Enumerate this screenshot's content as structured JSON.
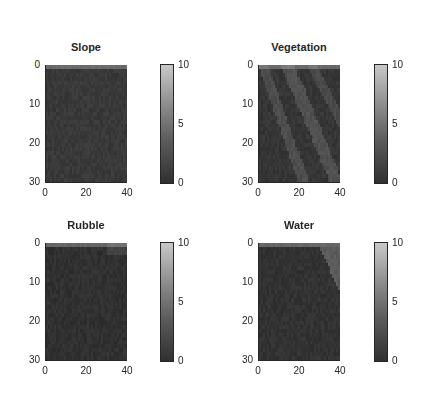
{
  "figure": {
    "layout": "2x2 subplots",
    "background": "#ffffff"
  },
  "chart_data": [
    {
      "type": "heatmap",
      "title": "Slope",
      "xlim": [
        0,
        40
      ],
      "ylim": [
        0,
        30
      ],
      "y_reversed": true,
      "xticks": [
        "0",
        "20",
        "40"
      ],
      "yticks": [
        "0",
        "10",
        "20",
        "30"
      ],
      "colorbar": {
        "range": [
          0,
          10
        ],
        "ticks": [
          "0",
          "5",
          "10"
        ],
        "colormap": "gray"
      },
      "pattern": "uniform low values (~1) across entire grid",
      "base_value": 1.0,
      "features": []
    },
    {
      "type": "heatmap",
      "title": "Vegetation",
      "xlim": [
        0,
        40
      ],
      "ylim": [
        0,
        30
      ],
      "y_reversed": true,
      "xticks": [
        "0",
        "20",
        "40"
      ],
      "yticks": [
        "0",
        "10",
        "20",
        "30"
      ],
      "colorbar": {
        "range": [
          0,
          10
        ],
        "ticks": [
          "0",
          "5",
          "10"
        ],
        "colormap": "gray"
      },
      "pattern": "low values with lighter diagonal bands running top-left to bottom-right",
      "base_value": 0.8,
      "features": [
        {
          "kind": "diagonal_band",
          "from": [
            2,
            0
          ],
          "to": [
            22,
            30
          ],
          "width": 4,
          "value": 2.2
        },
        {
          "kind": "diagonal_band",
          "from": [
            14,
            0
          ],
          "to": [
            38,
            30
          ],
          "width": 5,
          "value": 2.4
        },
        {
          "kind": "diagonal_band",
          "from": [
            26,
            0
          ],
          "to": [
            40,
            14
          ],
          "width": 4,
          "value": 2.0
        }
      ]
    },
    {
      "type": "heatmap",
      "title": "Rubble",
      "xlim": [
        0,
        40
      ],
      "ylim": [
        0,
        30
      ],
      "y_reversed": true,
      "xticks": [
        "0",
        "20",
        "40"
      ],
      "yticks": [
        "0",
        "10",
        "20",
        "30"
      ],
      "colorbar": {
        "range": [
          0,
          10
        ],
        "ticks": [
          "0",
          "5",
          "10"
        ],
        "colormap": "gray"
      },
      "pattern": "near-zero values everywhere, faint lighter patch at top-right",
      "base_value": 0.5,
      "features": [
        {
          "kind": "rect",
          "x": [
            30,
            40
          ],
          "y": [
            0,
            3
          ],
          "value": 1.6
        }
      ]
    },
    {
      "type": "heatmap",
      "title": "Water",
      "xlim": [
        0,
        40
      ],
      "ylim": [
        0,
        30
      ],
      "y_reversed": true,
      "xticks": [
        "0",
        "20",
        "40"
      ],
      "yticks": [
        "0",
        "10",
        "20",
        "30"
      ],
      "colorbar": {
        "range": [
          0,
          10
        ],
        "ticks": [
          "0",
          "5",
          "10"
        ],
        "colormap": "gray"
      },
      "pattern": "near-zero values with a lighter region in the top-right corner (cols ~31-40, rows ~1-11)",
      "base_value": 0.6,
      "features": [
        {
          "kind": "triangle",
          "x": [
            31,
            40
          ],
          "y": [
            1,
            12
          ],
          "value": 3.0
        }
      ]
    }
  ]
}
